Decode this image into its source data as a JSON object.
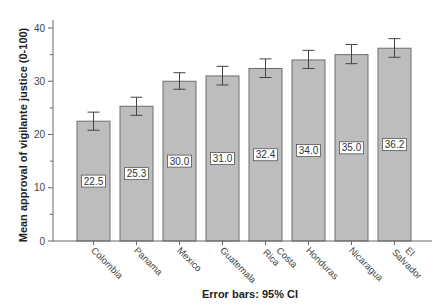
{
  "chart_data": {
    "type": "bar",
    "title": "",
    "xlabel": "",
    "ylabel": "Mean approval of vigilante justice (0-100)",
    "footnote": "Error bars: 95% CI",
    "ylim": [
      0,
      40
    ],
    "yticks": [
      0,
      10,
      20,
      30,
      40
    ],
    "grid": false,
    "legend": null,
    "categories": [
      "Colombia",
      "Panama",
      "Mexico",
      "Guatemala",
      "Costa Rica",
      "Honduras",
      "Nicaragua",
      "El Salvador"
    ],
    "category_lines": [
      [
        "Colombia"
      ],
      [
        "Panama"
      ],
      [
        "Mexico"
      ],
      [
        "Guatemala"
      ],
      [
        "Costa",
        "Rica"
      ],
      [
        "Honduras"
      ],
      [
        "Nicaragua"
      ],
      [
        "El",
        "Salvador"
      ]
    ],
    "values": [
      22.5,
      25.3,
      30.0,
      31.0,
      32.4,
      34.0,
      35.0,
      36.2
    ],
    "value_labels": [
      "22.5",
      "25.3",
      "30.0",
      "31.0",
      "32.4",
      "34.0",
      "35.0",
      "36.2"
    ],
    "ci_low": [
      20.8,
      23.6,
      28.5,
      29.3,
      30.7,
      32.4,
      33.3,
      34.5
    ],
    "ci_high": [
      24.2,
      27.0,
      31.6,
      32.8,
      34.2,
      35.8,
      36.9,
      38.0
    ],
    "colors": {
      "bar_fill": "#bdbdbd",
      "bar_stroke": "#6e6e6e",
      "axis": "#666666",
      "error_bar": "#444444"
    }
  }
}
